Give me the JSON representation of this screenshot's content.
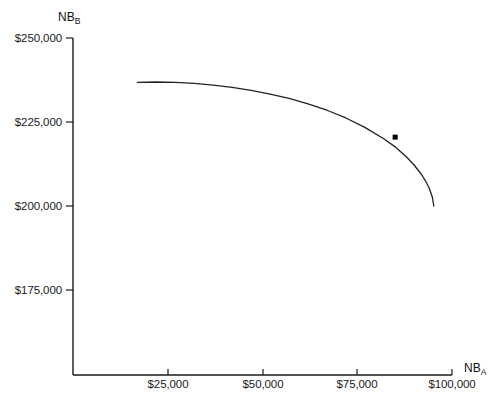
{
  "chart_data": {
    "type": "line",
    "title": "",
    "subtitle": "",
    "xlabel": "NB_A",
    "ylabel": "NB_B",
    "xlabel_base": "NB",
    "xlabel_sub": "A",
    "ylabel_base": "NB",
    "ylabel_sub": "B",
    "grid": false,
    "legend": "none",
    "xlim": [
      0,
      100000
    ],
    "ylim": [
      150000,
      250000
    ],
    "xticks": [
      25000,
      50000,
      75000,
      100000
    ],
    "xtick_labels": [
      "$25,000",
      "$50,000",
      "$75,000",
      "$100,000"
    ],
    "yticks": [
      250000,
      225000,
      200000,
      175000
    ],
    "ytick_labels": [
      "$250,000",
      "$225,000",
      "$200,000",
      "$175,000"
    ],
    "series": [
      {
        "name": "utility possibilities frontier",
        "color": "#222222",
        "points": [
          [
            17000,
            236800
          ],
          [
            22000,
            236900
          ],
          [
            27000,
            236800
          ],
          [
            32000,
            236500
          ],
          [
            37000,
            236000
          ],
          [
            42000,
            235300
          ],
          [
            47000,
            234400
          ],
          [
            52000,
            233300
          ],
          [
            57000,
            232000
          ],
          [
            62000,
            230400
          ],
          [
            67000,
            228500
          ],
          [
            72000,
            226200
          ],
          [
            77000,
            223400
          ],
          [
            82000,
            220000
          ],
          [
            85000,
            217600
          ],
          [
            88000,
            214600
          ],
          [
            90000,
            212200
          ],
          [
            92000,
            209300
          ],
          [
            93000,
            207500
          ],
          [
            94000,
            205300
          ],
          [
            94800,
            202700
          ],
          [
            95200,
            200000
          ]
        ]
      }
    ],
    "markers": [
      {
        "name": "selected-allocation-point",
        "x": 85000,
        "y": 220500,
        "color": "#000000",
        "size": 5
      }
    ]
  }
}
